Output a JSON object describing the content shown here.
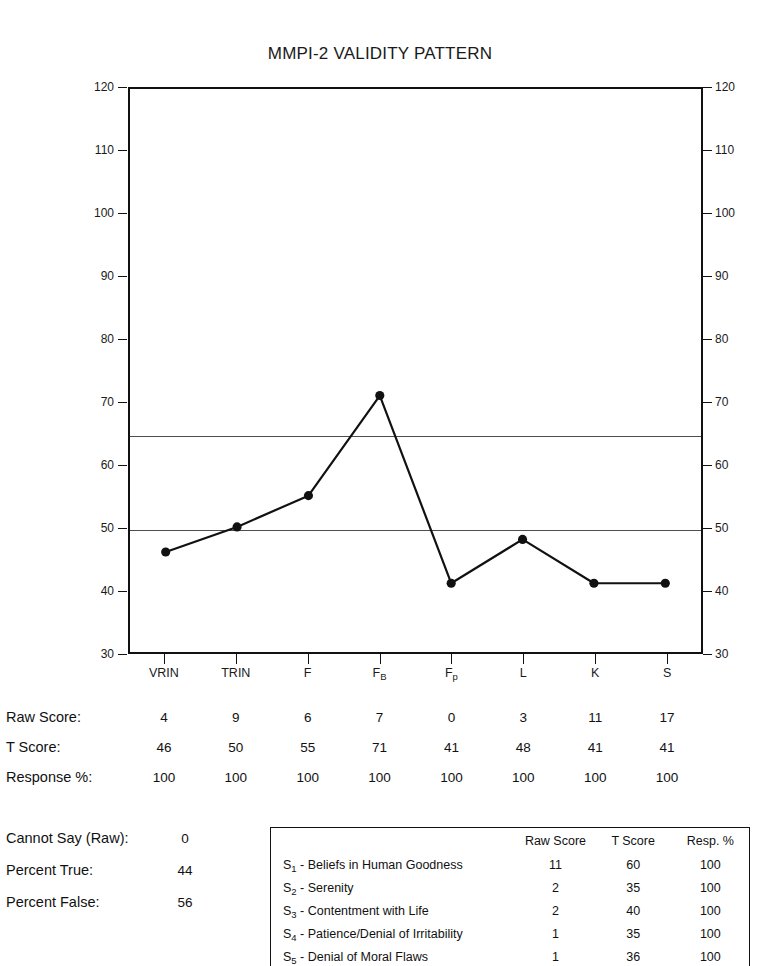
{
  "chart_data": {
    "type": "line",
    "title": "MMPI-2 VALIDITY PATTERN",
    "xlabel": "",
    "ylabel": "",
    "ylim": [
      30,
      120
    ],
    "yticks": [
      30,
      40,
      50,
      60,
      70,
      80,
      90,
      100,
      110,
      120
    ],
    "grid": false,
    "legend": "none",
    "reference_lines": [
      65,
      50
    ],
    "categories": [
      "VRIN",
      "TRIN",
      "F",
      "FB",
      "Fp",
      "L",
      "K",
      "S"
    ],
    "category_labels": [
      {
        "base": "VRIN",
        "sub": ""
      },
      {
        "base": "TRIN",
        "sub": ""
      },
      {
        "base": "F",
        "sub": ""
      },
      {
        "base": "F",
        "sub": "B"
      },
      {
        "base": "F",
        "sub": "p"
      },
      {
        "base": "L",
        "sub": ""
      },
      {
        "base": "K",
        "sub": ""
      },
      {
        "base": "S",
        "sub": ""
      }
    ],
    "series": [
      {
        "name": "T Score",
        "values": [
          46,
          50,
          55,
          71,
          41,
          48,
          41,
          41
        ]
      }
    ]
  },
  "chart": {
    "y_tick_labels": [
      "120",
      "110",
      "100",
      "90",
      "80",
      "70",
      "60",
      "50",
      "40",
      "30"
    ]
  },
  "score_rows": [
    {
      "label": "Raw Score:",
      "values": [
        "4",
        "9",
        "6",
        "7",
        "0",
        "3",
        "11",
        "17"
      ]
    },
    {
      "label": "T Score:",
      "values": [
        "46",
        "50",
        "55",
        "71",
        "41",
        "48",
        "41",
        "41"
      ]
    },
    {
      "label": "Response %:",
      "values": [
        "100",
        "100",
        "100",
        "100",
        "100",
        "100",
        "100",
        "100"
      ]
    }
  ],
  "summary": [
    {
      "label": "Cannot Say (Raw):",
      "value": "0"
    },
    {
      "label": "Percent True:",
      "value": "44"
    },
    {
      "label": "Percent False:",
      "value": "56"
    }
  ],
  "s_table": {
    "headers": [
      "",
      "Raw Score",
      "T Score",
      "Resp. %"
    ],
    "rows": [
      {
        "prefix": "S",
        "sub": "1",
        "name": " - Beliefs in Human Goodness",
        "raw": "11",
        "t": "60",
        "resp": "100"
      },
      {
        "prefix": "S",
        "sub": "2",
        "name": " - Serenity",
        "raw": "2",
        "t": "35",
        "resp": "100"
      },
      {
        "prefix": "S",
        "sub": "3",
        "name": " - Contentment with Life",
        "raw": "2",
        "t": "40",
        "resp": "100"
      },
      {
        "prefix": "S",
        "sub": "4",
        "name": " - Patience/Denial of Irritability",
        "raw": "1",
        "t": "35",
        "resp": "100"
      },
      {
        "prefix": "S",
        "sub": "5",
        "name": " - Denial of Moral Flaws",
        "raw": "1",
        "t": "36",
        "resp": "100"
      }
    ]
  },
  "colors": {
    "line": "#111111",
    "marker": "#111111",
    "frame": "#111111",
    "reference_line": "#4d4d52",
    "text": "#111111",
    "background": "#ffffff"
  }
}
